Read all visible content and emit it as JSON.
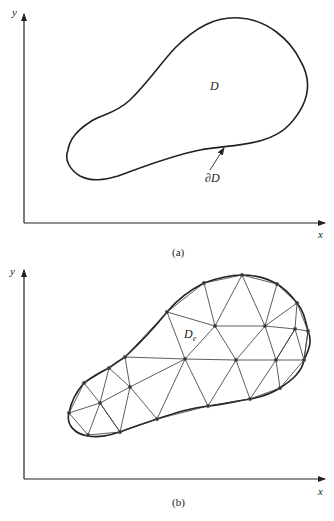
{
  "panel_a": {
    "y_label": "y",
    "x_label": "x",
    "region_label": "D",
    "boundary_label": "∂D",
    "caption": "(a)"
  },
  "panel_b": {
    "y_label": "y",
    "x_label": "x",
    "element_label": "D",
    "element_subscript": "e",
    "caption": "(b)",
    "nodes": [
      [
        69,
        413
      ],
      [
        84,
        383
      ],
      [
        109,
        368
      ],
      [
        125,
        357
      ],
      [
        167,
        312
      ],
      [
        204,
        283
      ],
      [
        242,
        275
      ],
      [
        277,
        284
      ],
      [
        297,
        303
      ],
      [
        308,
        331
      ],
      [
        304,
        360
      ],
      [
        280,
        388
      ],
      [
        250,
        399
      ],
      [
        208,
        406
      ],
      [
        157,
        419
      ],
      [
        120,
        432
      ],
      [
        88,
        435
      ],
      [
        100,
        403
      ],
      [
        130,
        387
      ],
      [
        185,
        359
      ],
      [
        236,
        360
      ],
      [
        276,
        360
      ],
      [
        215,
        326
      ],
      [
        265,
        326
      ],
      [
        295,
        329
      ]
    ],
    "edges": [
      [
        0,
        1
      ],
      [
        1,
        2
      ],
      [
        2,
        3
      ],
      [
        3,
        4
      ],
      [
        4,
        5
      ],
      [
        5,
        6
      ],
      [
        6,
        7
      ],
      [
        7,
        8
      ],
      [
        8,
        9
      ],
      [
        9,
        10
      ],
      [
        10,
        11
      ],
      [
        11,
        12
      ],
      [
        12,
        13
      ],
      [
        13,
        14
      ],
      [
        14,
        15
      ],
      [
        15,
        16
      ],
      [
        16,
        0
      ],
      [
        0,
        17
      ],
      [
        1,
        17
      ],
      [
        16,
        17
      ],
      [
        15,
        17
      ],
      [
        2,
        17
      ],
      [
        2,
        18
      ],
      [
        17,
        18
      ],
      [
        3,
        18
      ],
      [
        18,
        14
      ],
      [
        15,
        18
      ],
      [
        17,
        15
      ],
      [
        3,
        19
      ],
      [
        18,
        19
      ],
      [
        19,
        14
      ],
      [
        19,
        13
      ],
      [
        19,
        20
      ],
      [
        19,
        4
      ],
      [
        19,
        22
      ],
      [
        4,
        22
      ],
      [
        5,
        22
      ],
      [
        22,
        6
      ],
      [
        22,
        20
      ],
      [
        22,
        23
      ],
      [
        6,
        23
      ],
      [
        7,
        23
      ],
      [
        23,
        8
      ],
      [
        23,
        24
      ],
      [
        8,
        24
      ],
      [
        24,
        9
      ],
      [
        24,
        10
      ],
      [
        23,
        21
      ],
      [
        20,
        23
      ],
      [
        20,
        21
      ],
      [
        21,
        24
      ],
      [
        21,
        10
      ],
      [
        21,
        11
      ],
      [
        20,
        12
      ],
      [
        20,
        13
      ],
      [
        21,
        12
      ],
      [
        24,
        21
      ],
      [
        9,
        10
      ]
    ]
  }
}
